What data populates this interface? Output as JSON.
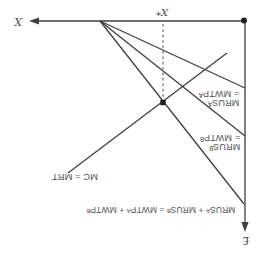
{
  "figure": {
    "type": "economics-diagram",
    "labels": {
      "axis_x": "X",
      "axis_money": "£",
      "optimal_quantity": "X*",
      "curve_a_line1": "MRUSᴬ",
      "curve_a_line2": "= MWTPᴬ",
      "curve_b_line1": "MRUSᴮ",
      "curve_b_line2": "= MWTPᴮ",
      "curve_aggregate": "MRUSᴬ + MRUSᴮ = MWTPᴬ + MWTPᴮ",
      "curve_mc": "MC = MRT"
    },
    "colors": {
      "line": "#3f3f3f",
      "dashed_line": "#6a6a6a",
      "point": "#1e1e1e",
      "text": "#555555",
      "background": "#ffffff"
    },
    "geometry": {
      "x_axis": {
        "x1": 245,
        "y1": 21,
        "x2": 36,
        "y2": 21,
        "arrow": "left"
      },
      "money_axis": {
        "x1": 245,
        "y1": 21,
        "x2": 245,
        "y2": 224,
        "arrow": "down"
      },
      "curve_a": {
        "x1": 100,
        "y1": 21,
        "x2": 245,
        "y2": 88
      },
      "curve_b": {
        "x1": 100,
        "y1": 21,
        "x2": 245,
        "y2": 136
      },
      "curve_aggregate": {
        "x1": 100,
        "y1": 21,
        "x2": 244,
        "y2": 204
      },
      "curve_mc": {
        "x1": 68,
        "y1": 173,
        "x2": 227,
        "y2": 53
      },
      "dashed_line": {
        "x1": 163,
        "y1": 24,
        "x2": 163,
        "y2": 99
      },
      "equilibrium_point": {
        "x": 163,
        "y": 102.5
      },
      "corner_point": {
        "x": 244,
        "y": 20.5
      }
    }
  }
}
